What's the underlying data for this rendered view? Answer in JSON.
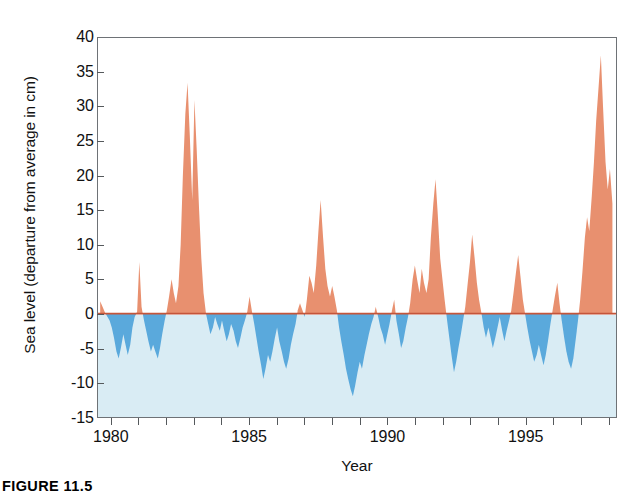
{
  "figure": {
    "caption": "FIGURE 11.5"
  },
  "chart_data": {
    "type": "area",
    "title": "",
    "subtitle": "",
    "xlabel": "Year",
    "ylabel": "Sea level (departure from average in cm)",
    "xlim": [
      1979.5,
      1998.3
    ],
    "ylim": [
      -15,
      40
    ],
    "ytick_labels": [
      "40",
      "35",
      "30",
      "25",
      "20",
      "15",
      "10",
      "5",
      "0",
      "-5",
      "-10",
      "-15"
    ],
    "yticks": [
      40,
      35,
      30,
      25,
      20,
      15,
      10,
      5,
      0,
      -5,
      -10,
      -15
    ],
    "xtick_labels": [
      "1980",
      "1985",
      "1990",
      "1995"
    ],
    "xticks_major": [
      1980,
      1985,
      1990,
      1995
    ],
    "xticks_minor": [
      1981,
      1982,
      1983,
      1984,
      1986,
      1987,
      1988,
      1989,
      1991,
      1992,
      1993,
      1994,
      1996,
      1997,
      1998
    ],
    "grid": false,
    "legend": "none",
    "baseline": 0,
    "colors": {
      "positive_fill": "#e8906f",
      "negative_fill": "#5aa9dc",
      "plot_background_below_zero": "#d9ecf4",
      "plot_background_above_zero": "#ffffff",
      "axis_line": "#6e7276",
      "baseline_line": "#c4553a",
      "text": "#111111"
    },
    "x": [
      1979.58,
      1979.75,
      1979.92,
      1980.0,
      1980.08,
      1980.17,
      1980.25,
      1980.33,
      1980.42,
      1980.5,
      1980.58,
      1980.67,
      1980.75,
      1980.83,
      1980.92,
      1981.0,
      1981.08,
      1981.17,
      1981.25,
      1981.33,
      1981.42,
      1981.5,
      1981.58,
      1981.67,
      1981.75,
      1981.83,
      1981.92,
      1982.0,
      1982.08,
      1982.17,
      1982.25,
      1982.33,
      1982.42,
      1982.5,
      1982.58,
      1982.67,
      1982.75,
      1982.83,
      1982.92,
      1983.0,
      1983.08,
      1983.17,
      1983.25,
      1983.33,
      1983.42,
      1983.5,
      1983.58,
      1983.67,
      1983.75,
      1983.83,
      1983.92,
      1984.0,
      1984.08,
      1984.17,
      1984.25,
      1984.33,
      1984.42,
      1984.5,
      1984.58,
      1984.67,
      1984.75,
      1984.83,
      1984.92,
      1985.0,
      1985.08,
      1985.17,
      1985.25,
      1985.33,
      1985.42,
      1985.5,
      1985.58,
      1985.67,
      1985.75,
      1985.83,
      1985.92,
      1986.0,
      1986.08,
      1986.17,
      1986.25,
      1986.33,
      1986.42,
      1986.5,
      1986.58,
      1986.67,
      1986.75,
      1986.83,
      1986.92,
      1987.0,
      1987.08,
      1987.17,
      1987.25,
      1987.33,
      1987.42,
      1987.5,
      1987.58,
      1987.67,
      1987.75,
      1987.83,
      1987.92,
      1988.0,
      1988.08,
      1988.17,
      1988.25,
      1988.33,
      1988.42,
      1988.5,
      1988.58,
      1988.67,
      1988.75,
      1988.83,
      1988.92,
      1989.0,
      1989.08,
      1989.17,
      1989.25,
      1989.33,
      1989.42,
      1989.5,
      1989.58,
      1989.67,
      1989.75,
      1989.83,
      1989.92,
      1990.0,
      1990.08,
      1990.17,
      1990.25,
      1990.33,
      1990.42,
      1990.5,
      1990.58,
      1990.67,
      1990.75,
      1990.83,
      1990.92,
      1991.0,
      1991.08,
      1991.17,
      1991.25,
      1991.33,
      1991.42,
      1991.5,
      1991.58,
      1991.67,
      1991.75,
      1991.83,
      1991.92,
      1992.0,
      1992.08,
      1992.17,
      1992.25,
      1992.33,
      1992.42,
      1992.5,
      1992.58,
      1992.67,
      1992.75,
      1992.83,
      1992.92,
      1993.0,
      1993.08,
      1993.17,
      1993.25,
      1993.33,
      1993.42,
      1993.5,
      1993.58,
      1993.67,
      1993.75,
      1993.83,
      1993.92,
      1994.0,
      1994.08,
      1994.17,
      1994.25,
      1994.33,
      1994.42,
      1994.5,
      1994.58,
      1994.67,
      1994.75,
      1994.83,
      1994.92,
      1995.0,
      1995.08,
      1995.17,
      1995.25,
      1995.33,
      1995.42,
      1995.5,
      1995.58,
      1995.67,
      1995.75,
      1995.83,
      1995.92,
      1996.0,
      1996.08,
      1996.17,
      1996.25,
      1996.33,
      1996.42,
      1996.5,
      1996.58,
      1996.67,
      1996.75,
      1996.83,
      1996.92,
      1997.0,
      1997.08,
      1997.17,
      1997.25,
      1997.33,
      1997.42,
      1997.5,
      1997.58,
      1997.67,
      1997.75,
      1997.83,
      1997.92,
      1998.0,
      1998.08,
      1998.17
    ],
    "values": [
      1.8,
      0.2,
      -1.0,
      -2.0,
      -3.5,
      -5.5,
      -6.5,
      -5.0,
      -3.0,
      -4.5,
      -6.0,
      -4.5,
      -2.0,
      -0.5,
      0.3,
      7.5,
      1.0,
      -1.0,
      -2.5,
      -4.0,
      -5.5,
      -4.5,
      -5.5,
      -6.5,
      -5.0,
      -3.0,
      -1.0,
      0.5,
      2.5,
      5.0,
      3.0,
      1.5,
      4.0,
      10.0,
      20.0,
      29.0,
      33.5,
      26.0,
      16.5,
      31.0,
      24.0,
      15.0,
      8.0,
      3.0,
      0.0,
      -1.5,
      -3.0,
      -2.0,
      -0.5,
      -1.5,
      -2.5,
      -1.0,
      -2.5,
      -4.0,
      -3.0,
      -1.5,
      -2.5,
      -4.0,
      -5.0,
      -3.5,
      -2.0,
      -1.0,
      0.3,
      2.5,
      0.5,
      -1.5,
      -3.5,
      -5.5,
      -7.5,
      -9.5,
      -8.0,
      -6.0,
      -7.0,
      -5.5,
      -3.5,
      -2.0,
      -4.0,
      -5.5,
      -7.0,
      -8.0,
      -6.5,
      -4.5,
      -3.0,
      -1.5,
      0.5,
      1.5,
      0.5,
      -0.5,
      2.0,
      5.5,
      4.5,
      3.0,
      7.0,
      12.0,
      16.5,
      11.0,
      6.5,
      4.0,
      2.5,
      4.0,
      2.5,
      0.5,
      -2.0,
      -4.0,
      -6.0,
      -8.0,
      -9.5,
      -11.0,
      -12.0,
      -10.5,
      -8.5,
      -7.0,
      -8.0,
      -6.0,
      -4.5,
      -3.0,
      -1.5,
      -0.5,
      1.0,
      -0.5,
      -2.0,
      -3.0,
      -4.5,
      -3.0,
      -1.5,
      0.5,
      2.0,
      -1.0,
      -3.0,
      -5.0,
      -4.0,
      -2.0,
      -0.5,
      1.5,
      5.0,
      7.0,
      5.0,
      3.0,
      6.5,
      4.5,
      3.0,
      5.0,
      11.0,
      16.0,
      19.5,
      14.5,
      8.0,
      5.0,
      2.0,
      -1.0,
      -3.5,
      -6.0,
      -8.5,
      -7.0,
      -5.0,
      -3.0,
      -1.0,
      1.0,
      4.5,
      7.5,
      11.5,
      8.0,
      4.5,
      2.0,
      0.0,
      -2.0,
      -3.5,
      -2.0,
      -3.5,
      -5.0,
      -3.5,
      -2.0,
      -0.5,
      -2.5,
      -4.0,
      -2.5,
      -1.0,
      0.5,
      3.0,
      6.0,
      8.5,
      5.5,
      2.0,
      0.0,
      -2.0,
      -4.0,
      -5.5,
      -7.0,
      -6.0,
      -4.5,
      -6.0,
      -7.5,
      -6.0,
      -4.0,
      -1.5,
      0.5,
      2.5,
      4.5,
      1.5,
      -1.0,
      -3.5,
      -5.5,
      -7.0,
      -8.0,
      -6.5,
      -4.0,
      -1.0,
      2.0,
      6.0,
      11.0,
      14.0,
      12.0,
      17.0,
      22.0,
      28.0,
      33.0,
      37.5,
      30.0,
      22.0,
      18.0,
      21.0,
      16.0
    ]
  }
}
